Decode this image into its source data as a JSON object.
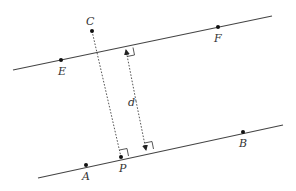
{
  "diagram": {
    "lines": [
      {
        "name": "line-EF",
        "from": [
          13,
          70
        ],
        "to": [
          272,
          16
        ]
      },
      {
        "name": "line-AB",
        "from": [
          38,
          178
        ],
        "to": [
          283,
          125
        ]
      }
    ],
    "points": [
      {
        "id": "C",
        "label": "C",
        "x": 92,
        "y": 31,
        "lx": 86,
        "ly": 24
      },
      {
        "id": "E",
        "label": "E",
        "x": 61,
        "y": 60,
        "lx": 58,
        "ly": 75
      },
      {
        "id": "F",
        "label": "F",
        "x": 218,
        "y": 27,
        "lx": 215,
        "ly": 42
      },
      {
        "id": "A",
        "label": "A",
        "x": 86,
        "y": 165,
        "lx": 82,
        "ly": 180
      },
      {
        "id": "P",
        "label": "P",
        "x": 121,
        "y": 157,
        "lx": 119,
        "ly": 172
      },
      {
        "id": "B",
        "label": "B",
        "x": 243,
        "y": 132,
        "lx": 240,
        "ly": 147
      }
    ],
    "distance_label": "d",
    "labels": {
      "C": "C",
      "E": "E",
      "F": "F",
      "A": "A",
      "P": "P",
      "B": "B",
      "d": "d"
    }
  }
}
